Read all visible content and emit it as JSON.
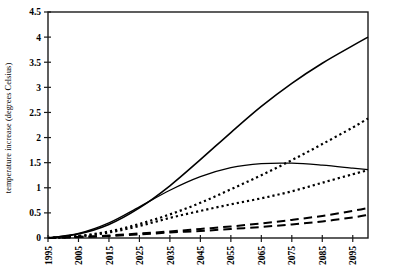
{
  "chart_data": {
    "type": "line",
    "title": "",
    "xlabel": "",
    "ylabel": "temperature increase (degrees Celsius)",
    "xlim": [
      1995,
      2100
    ],
    "ylim": [
      0,
      4.5
    ],
    "grid": false,
    "legend": "none",
    "xticks": [
      "1995",
      "2005",
      "2015",
      "2025",
      "2035",
      "2045",
      "2055",
      "2065",
      "2075",
      "2085",
      "2095"
    ],
    "xtick_values": [
      1995,
      2005,
      2015,
      2025,
      2035,
      2045,
      2055,
      2065,
      2075,
      2085,
      2095
    ],
    "yticks": [
      "0",
      "0.5",
      "1",
      "1.5",
      "2",
      "2.5",
      "3",
      "3.5",
      "4",
      "4.5"
    ],
    "ytick_values": [
      0,
      0.5,
      1,
      1.5,
      2,
      2.5,
      3,
      3.5,
      4,
      4.5
    ],
    "x": [
      1995,
      2005,
      2015,
      2025,
      2035,
      2045,
      2055,
      2065,
      2075,
      2085,
      2095,
      2100
    ],
    "series": [
      {
        "name": "high scenario",
        "style": "solid",
        "linewidth": 1.6,
        "color": "#000000",
        "values": [
          0.0,
          0.08,
          0.27,
          0.6,
          1.04,
          1.56,
          2.1,
          2.62,
          3.08,
          3.48,
          3.83,
          4.0
        ]
      },
      {
        "name": "stabilisation scenario",
        "style": "solid",
        "linewidth": 1.3,
        "color": "#000000",
        "values": [
          0.0,
          0.09,
          0.3,
          0.62,
          0.95,
          1.22,
          1.4,
          1.48,
          1.49,
          1.45,
          1.39,
          1.36
        ]
      },
      {
        "name": "upper dotted scenario",
        "style": "dotted",
        "linewidth": 2.2,
        "color": "#000000",
        "values": [
          0.0,
          0.04,
          0.13,
          0.28,
          0.47,
          0.7,
          0.97,
          1.25,
          1.55,
          1.87,
          2.2,
          2.38
        ]
      },
      {
        "name": "lower dotted scenario",
        "style": "dotted",
        "linewidth": 2.2,
        "color": "#000000",
        "values": [
          0.0,
          0.03,
          0.11,
          0.24,
          0.4,
          0.54,
          0.67,
          0.79,
          0.93,
          1.1,
          1.27,
          1.35
        ]
      },
      {
        "name": "upper dashed scenario",
        "style": "dashed",
        "linewidth": 2.0,
        "color": "#000000",
        "values": [
          0.0,
          0.02,
          0.05,
          0.09,
          0.13,
          0.18,
          0.23,
          0.29,
          0.36,
          0.44,
          0.54,
          0.6
        ]
      },
      {
        "name": "lower dashed scenario",
        "style": "dashed",
        "linewidth": 2.0,
        "color": "#000000",
        "values": [
          0.0,
          0.02,
          0.04,
          0.07,
          0.11,
          0.14,
          0.18,
          0.22,
          0.27,
          0.33,
          0.41,
          0.46
        ]
      }
    ]
  },
  "axis": {
    "frame_color": "#1a1a1a",
    "tick_color": "#1a1a1a"
  }
}
